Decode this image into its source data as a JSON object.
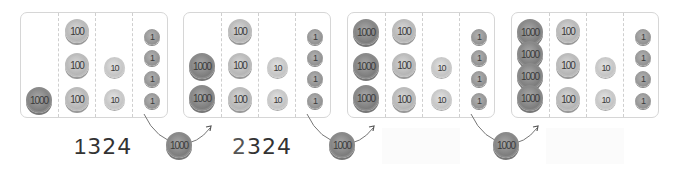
{
  "coin_labels": {
    "thousand": "1000",
    "hundred": "100",
    "ten": "10",
    "one": "1"
  },
  "colors": {
    "box_border": "#d6d6d6",
    "coin_dark": "#7d7d7d",
    "coin_light": "#b5b5b5",
    "text": "#333333"
  },
  "steps": [
    {
      "thousands": 1,
      "hundreds": 3,
      "tens": 2,
      "ones": 4,
      "number_label": "1324",
      "visible": true
    },
    {
      "thousands": 2,
      "hundreds": 3,
      "tens": 2,
      "ones": 4,
      "number_label": "2324",
      "visible": true
    },
    {
      "thousands": 3,
      "hundreds": 3,
      "tens": 2,
      "ones": 4,
      "number_label": "",
      "visible": false
    },
    {
      "thousands": 4,
      "hundreds": 3,
      "tens": 2,
      "ones": 4,
      "number_label": "",
      "visible": false
    }
  ],
  "transitions": [
    {
      "coin_label": "1000",
      "meaning": "add one thousand"
    },
    {
      "coin_label": "1000",
      "meaning": "add one thousand"
    },
    {
      "coin_label": "1000",
      "meaning": "add one thousand"
    }
  ],
  "numbers": {
    "step1_first": "1",
    "step1_rest": "324",
    "step2_first": "2",
    "step2_rest": "324"
  }
}
